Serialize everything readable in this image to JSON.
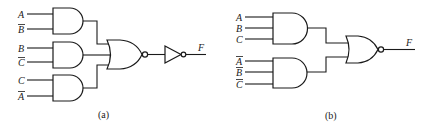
{
  "diagram_a": {
    "caption": "(a)",
    "output_label": "F",
    "and_gates": [
      {
        "inputs": [
          {
            "name": "A",
            "inverted": false
          },
          {
            "name": "B",
            "inverted": true
          }
        ]
      },
      {
        "inputs": [
          {
            "name": "B",
            "inverted": false
          },
          {
            "name": "C",
            "inverted": true
          }
        ]
      },
      {
        "inputs": [
          {
            "name": "C",
            "inverted": false
          },
          {
            "name": "A",
            "inverted": true
          }
        ]
      }
    ],
    "combiner": "NOR",
    "final_stage": "NOT"
  },
  "diagram_b": {
    "caption": "(b)",
    "output_label": "F",
    "and_gates": [
      {
        "inputs": [
          {
            "name": "A",
            "inverted": false
          },
          {
            "name": "B",
            "inverted": false
          },
          {
            "name": "C",
            "inverted": false
          }
        ]
      },
      {
        "inputs": [
          {
            "name": "A",
            "inverted": true
          },
          {
            "name": "B",
            "inverted": true
          },
          {
            "name": "C",
            "inverted": true
          }
        ]
      }
    ],
    "combiner": "NOR"
  },
  "colors": {
    "ink": "#1a1a1a",
    "background": "#ffffff"
  }
}
